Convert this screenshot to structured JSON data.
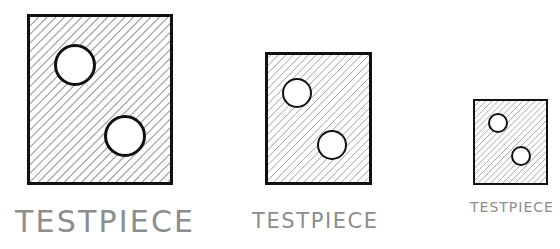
{
  "diagram": {
    "background_color": "#ffffff",
    "line_color": "#111111",
    "hatch_color": "#9a9a9a",
    "label_color": "#8d8d8d",
    "hole_fill": "#ffffff",
    "plate_fill": "#ffffff"
  },
  "specimens": [
    {
      "id": "large",
      "label": "TESTPIECE",
      "size_rank": "large",
      "plate": {
        "x": 27,
        "y": 14,
        "width": 146,
        "height": 171,
        "border_width": 3
      },
      "holes": [
        {
          "name": "upper-hole",
          "cx": 75,
          "cy": 65,
          "r": 21,
          "border_width": 3
        },
        {
          "name": "lower-hole",
          "cx": 125,
          "cy": 136,
          "r": 21,
          "border_width": 3
        }
      ],
      "hatch": {
        "spacing": 9,
        "stroke_width": 1.1,
        "angle_deg": 45
      },
      "label_style": {
        "x": 15,
        "y": 207,
        "font_size": 30,
        "letter_spacing": 2.2
      }
    },
    {
      "id": "medium",
      "label": "TESTPIECE",
      "size_rank": "medium",
      "plate": {
        "x": 265,
        "y": 52,
        "width": 107,
        "height": 133,
        "border_width": 3
      },
      "holes": [
        {
          "name": "upper-hole",
          "cx": 297,
          "cy": 93,
          "r": 15,
          "border_width": 2.5
        },
        {
          "name": "lower-hole",
          "cx": 332,
          "cy": 145,
          "r": 15,
          "border_width": 2.5
        }
      ],
      "hatch": {
        "spacing": 8,
        "stroke_width": 1.0,
        "angle_deg": 45
      },
      "label_style": {
        "x": 252,
        "y": 211,
        "font_size": 21,
        "letter_spacing": 1.6
      }
    },
    {
      "id": "small",
      "label": "TESTPIECE",
      "size_rank": "small",
      "plate": {
        "x": 473,
        "y": 99,
        "width": 75,
        "height": 86,
        "border_width": 2.5
      },
      "holes": [
        {
          "name": "upper-hole",
          "cx": 498,
          "cy": 123,
          "r": 10,
          "border_width": 2
        },
        {
          "name": "lower-hole",
          "cx": 521,
          "cy": 156,
          "r": 10,
          "border_width": 2
        }
      ],
      "hatch": {
        "spacing": 6.5,
        "stroke_width": 0.9,
        "angle_deg": 45
      },
      "label_style": {
        "x": 470,
        "y": 200,
        "font_size": 14,
        "letter_spacing": 1.0
      }
    }
  ]
}
